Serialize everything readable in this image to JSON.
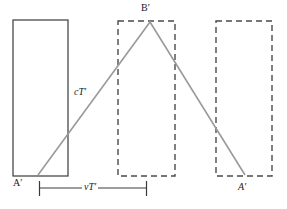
{
  "figure": {
    "colors": {
      "background": "#ffffff",
      "solid_box_stroke": "#3a3a3a",
      "dashed_box_stroke": "#4a4a4a",
      "light_path": "#9a9a9a",
      "measure_line": "#3a3a3a",
      "text": "#1a1a1a"
    },
    "labels": {
      "apex": "B′",
      "start_point": "A′",
      "end_point": "A′",
      "light_path": "cT′",
      "baseline_measure": "vT′"
    },
    "boxes": [
      {
        "name": "box-left-solid",
        "style": "solid",
        "x": 13,
        "y": 20,
        "width": 55,
        "height": 156
      },
      {
        "name": "box-middle-dashed",
        "style": "dashed",
        "x": 118,
        "y": 21,
        "width": 57,
        "height": 155
      },
      {
        "name": "box-right-dashed",
        "style": "dashed",
        "x": 216,
        "y": 21,
        "width": 56,
        "height": 155
      }
    ],
    "light_path": {
      "type": "polyline",
      "points": [
        {
          "name": "A-prime-start",
          "x": 38,
          "y": 175
        },
        {
          "name": "B-prime-apex",
          "x": 150,
          "y": 22
        },
        {
          "name": "A-prime-end",
          "x": 245,
          "y": 175
        }
      ]
    },
    "measure": {
      "name": "vT-prime-baseline",
      "y": 188,
      "x_start": 39,
      "x_end": 147,
      "tick_top": 181,
      "tick_bottom": 196
    }
  }
}
